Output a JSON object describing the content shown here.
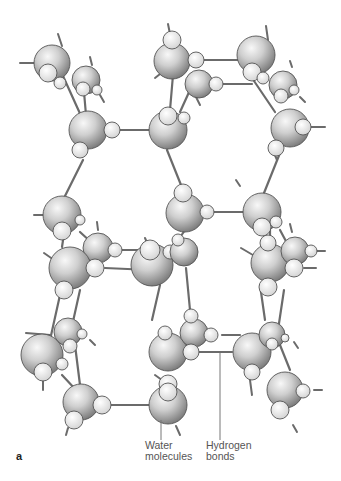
{
  "figure": {
    "panel_letter": "a",
    "labels": {
      "water_line1": "Water",
      "water_line2": "molecules",
      "hbond_line1": "Hydrogen",
      "hbond_line2": "bonds"
    },
    "colors": {
      "oxygen_light": "#f2f2f2",
      "oxygen_dark": "#8a8a8a",
      "hydrogen_fill": "#e6e6e6",
      "bond_stroke": "#6b6b6b",
      "outline": "#555555",
      "leader_line": "#777777",
      "label_text": "#555555"
    }
  }
}
